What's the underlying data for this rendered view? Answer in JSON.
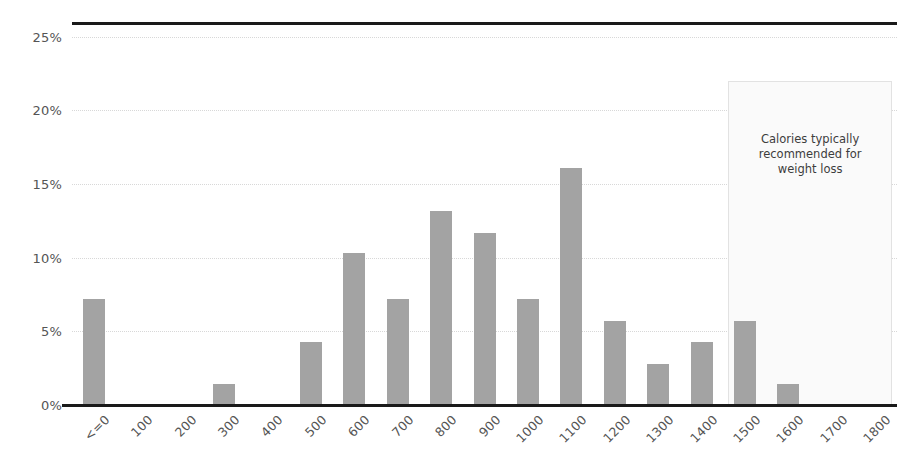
{
  "chart_data": {
    "type": "bar",
    "title": "",
    "subtitle": "",
    "xlabel": "",
    "ylabel": "",
    "categories": [
      "<=0",
      "100",
      "200",
      "300",
      "400",
      "500",
      "600",
      "700",
      "800",
      "900",
      "1000",
      "1100",
      "1200",
      "1300",
      "1400",
      "1500",
      "1600",
      "1700",
      "1800"
    ],
    "values": [
      7.2,
      0,
      0,
      1.4,
      0,
      4.3,
      10.3,
      7.2,
      13.2,
      11.7,
      7.2,
      16.1,
      5.7,
      2.8,
      4.3,
      5.7,
      1.4,
      0,
      0
    ],
    "value_labels": [
      "7.2%",
      "0%",
      "0%",
      "1.4%",
      "0%",
      "4.3%",
      "10.3%",
      "7.2%",
      "13.2%",
      "11.7%",
      "7.2%",
      "16.1%",
      "5.7%",
      "2.8%",
      "4.3%",
      "5.7%",
      "1.4%",
      "0%",
      "0%"
    ],
    "ylim": [
      0,
      26
    ],
    "yticks": [
      0,
      5,
      10,
      15,
      20,
      25
    ],
    "ytick_labels": [
      "0%",
      "5%",
      "10%",
      "15%",
      "20%",
      "25%"
    ],
    "grid": true,
    "grid_axis": "y",
    "legend": false,
    "legend_position": "none",
    "bar_color": "#a3a3a3",
    "axis_color": "#1a1a1a",
    "gridline_color": "#d8d8d8",
    "annotations": [
      {
        "name": "recommended-range",
        "text": "Calories typically\nrecommended for\nweight loss",
        "x_start_category": "1500",
        "x_end_category": "1800",
        "y_start": 0,
        "y_end": 22,
        "fill_color": "#fafafa",
        "border_color": "#e2e2e2",
        "text_color": "#3d3d3d"
      }
    ]
  }
}
